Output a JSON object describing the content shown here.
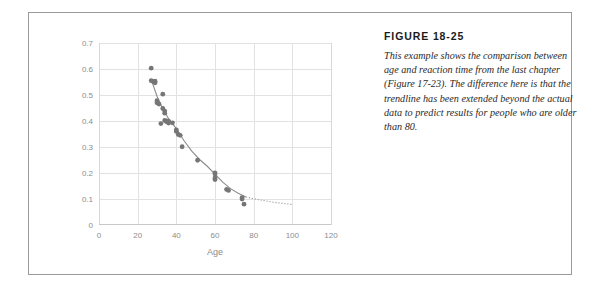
{
  "figure": {
    "title": "FIGURE 18-25",
    "caption": "This example shows the comparison between age and reaction time from the last chapter (Figure 17-23). The difference here is that the trendline has been extended beyond the actual data to predict results for people who are older than 80."
  },
  "colors": {
    "marker": "#767676",
    "trendline": "#8c8c8c",
    "gridline": "#e2e2e2",
    "axis_text": "#8c8c8c",
    "frame": "#9a9a9a"
  },
  "chart_data": {
    "type": "scatter",
    "title": "",
    "xlabel": "Age",
    "ylabel": "",
    "xlim": [
      0,
      120
    ],
    "ylim": [
      0,
      0.7
    ],
    "xticks": [
      0,
      20,
      40,
      60,
      80,
      100,
      120
    ],
    "yticks": [
      "0",
      "0.1",
      "0.2",
      "0.3",
      "0.4",
      "0.5",
      "0.6",
      "0.7"
    ],
    "ytick_values": [
      0,
      0.1,
      0.2,
      0.3,
      0.4,
      0.5,
      0.6,
      0.7
    ],
    "grid": true,
    "legend": "none",
    "points": [
      [
        27,
        0.603
      ],
      [
        27,
        0.555
      ],
      [
        28,
        0.552
      ],
      [
        29,
        0.553
      ],
      [
        29,
        0.547
      ],
      [
        30,
        0.47
      ],
      [
        30,
        0.478
      ],
      [
        31,
        0.465
      ],
      [
        33,
        0.503
      ],
      [
        33,
        0.448
      ],
      [
        34,
        0.438
      ],
      [
        34,
        0.43
      ],
      [
        34,
        0.402
      ],
      [
        35,
        0.397
      ],
      [
        35,
        0.4
      ],
      [
        36,
        0.398
      ],
      [
        36,
        0.392
      ],
      [
        32,
        0.39
      ],
      [
        38,
        0.393
      ],
      [
        40,
        0.366
      ],
      [
        40,
        0.36
      ],
      [
        41,
        0.348
      ],
      [
        42,
        0.345
      ],
      [
        43,
        0.301
      ],
      [
        51,
        0.249
      ],
      [
        60,
        0.2
      ],
      [
        60,
        0.196
      ],
      [
        60,
        0.181
      ],
      [
        60,
        0.175
      ],
      [
        66,
        0.137
      ],
      [
        67,
        0.133
      ],
      [
        74,
        0.105
      ],
      [
        74,
        0.1
      ],
      [
        75,
        0.08
      ]
    ],
    "trendline": {
      "style_fitted": "solid",
      "style_extended": "dotted",
      "description": "Power trendline through the data, extended beyond age 80 to predict results for older people",
      "fitted_range": [
        27,
        76
      ],
      "extended_range": [
        76,
        100
      ],
      "sampled": [
        [
          27,
          0.56
        ],
        [
          30,
          0.495
        ],
        [
          33,
          0.447
        ],
        [
          36,
          0.409
        ],
        [
          40,
          0.371
        ],
        [
          44,
          0.324
        ],
        [
          48,
          0.284
        ],
        [
          52,
          0.252
        ],
        [
          56,
          0.226
        ],
        [
          60,
          0.196
        ],
        [
          64,
          0.165
        ],
        [
          68,
          0.14
        ],
        [
          72,
          0.122
        ],
        [
          76,
          0.108
        ],
        [
          80,
          0.101
        ],
        [
          85,
          0.094
        ],
        [
          90,
          0.088
        ],
        [
          95,
          0.083
        ],
        [
          100,
          0.079
        ]
      ]
    }
  }
}
